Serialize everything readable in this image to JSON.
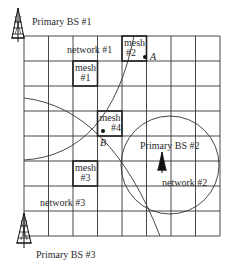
{
  "diagram": {
    "grid": {
      "cols": 8,
      "rows": 8,
      "left": 24,
      "top": 36,
      "cell": 24.5
    },
    "base_stations": [
      {
        "label": "Primary BS #1",
        "position": "top-left"
      },
      {
        "label": "Primary BS #2",
        "position": "center-right"
      },
      {
        "label": "Primary BS #3",
        "position": "bottom-left"
      }
    ],
    "networks": [
      {
        "label": "network #1"
      },
      {
        "label": "network #2"
      },
      {
        "label": "network #3"
      }
    ],
    "mesh_nodes": [
      {
        "line1": "mesh",
        "line2": "#1"
      },
      {
        "line1": "mesh",
        "line2": "#2"
      },
      {
        "line1": "mesh",
        "line2": "#3"
      },
      {
        "line1": "mesh",
        "line2": "#4"
      }
    ],
    "points": [
      {
        "label": "A"
      },
      {
        "label": "B"
      }
    ]
  }
}
